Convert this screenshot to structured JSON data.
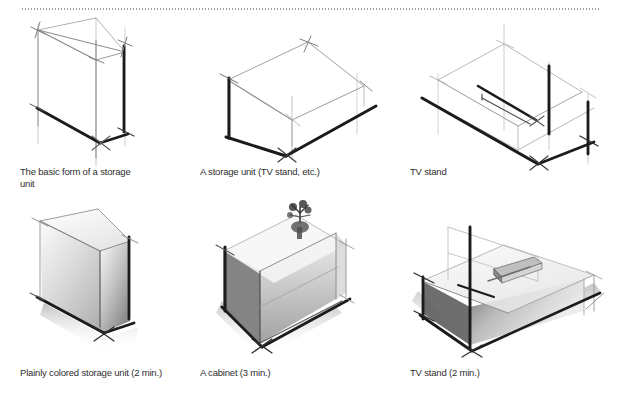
{
  "page": {
    "background_color": "#ffffff",
    "ink_color": "#1a1a1a",
    "light_ink_color": "#b5b5b5",
    "rule_color": "#9a9a9a"
  },
  "divider": {
    "name": "dotted-rule",
    "style": "dotted",
    "color": "#9a9a9a"
  },
  "figures": [
    {
      "id": "fig-1",
      "row": 1,
      "column": 1,
      "caption": "The basic form of a storage\nunit",
      "subject": "storage-unit-wireframe",
      "shaded": false,
      "time_note": ""
    },
    {
      "id": "fig-2",
      "row": 1,
      "column": 2,
      "caption": "A storage unit (TV stand, etc.)",
      "subject": "low-storage-unit-wireframe",
      "shaded": false,
      "time_note": ""
    },
    {
      "id": "fig-3",
      "row": 1,
      "column": 3,
      "caption": "TV stand",
      "subject": "tv-stand-wireframe",
      "shaded": false,
      "time_note": ""
    },
    {
      "id": "fig-4",
      "row": 2,
      "column": 1,
      "caption": "Plainly colored storage unit (2 min.)",
      "subject": "storage-unit-shaded",
      "shaded": true,
      "time_note": "2 min."
    },
    {
      "id": "fig-5",
      "row": 2,
      "column": 2,
      "caption": "A cabinet (3 min.)",
      "subject": "cabinet-shaded-with-plant",
      "shaded": true,
      "time_note": "3 min."
    },
    {
      "id": "fig-6",
      "row": 2,
      "column": 3,
      "caption": "TV stand (2 min.)",
      "subject": "tv-stand-shaded",
      "shaded": true,
      "time_note": "2 min."
    }
  ]
}
